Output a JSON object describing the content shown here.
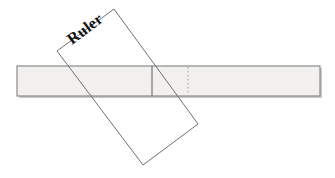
{
  "figure": {
    "canvas": {
      "width": 335,
      "height": 178,
      "background": "#ffffff"
    },
    "strip": {
      "name": "measuring-strip",
      "x": 17,
      "y": 66,
      "width": 303,
      "height": 30,
      "fill": "#f1f0ee",
      "stroke": "#8a8a8a",
      "stroke_width": 1.2,
      "shadow_color": "#9a9a9a"
    },
    "strip_marks": [
      {
        "name": "solid-division-line",
        "style": "solid",
        "x": 152,
        "y1": 66,
        "y2": 96,
        "stroke": "#5a5a5a",
        "stroke_width": 1
      },
      {
        "name": "dotted-division-line",
        "style": "dotted",
        "x": 188,
        "y1": 67,
        "y2": 95,
        "stroke": "#9b9b9b",
        "stroke_width": 1,
        "dash": "1.5 2.5"
      }
    ],
    "ruler": {
      "name": "ruler-rectangle",
      "points": "114,9 198,124 143,165 57,51",
      "fill": "none",
      "stroke": "#6f6f6f",
      "stroke_width": 1,
      "rotation_deg": -37
    },
    "ruler_label": {
      "text": "Ruler",
      "x": 72,
      "y": 45,
      "rotation_deg": -37,
      "color": "#111111",
      "font_size": 16,
      "font_weight": "bold"
    }
  }
}
